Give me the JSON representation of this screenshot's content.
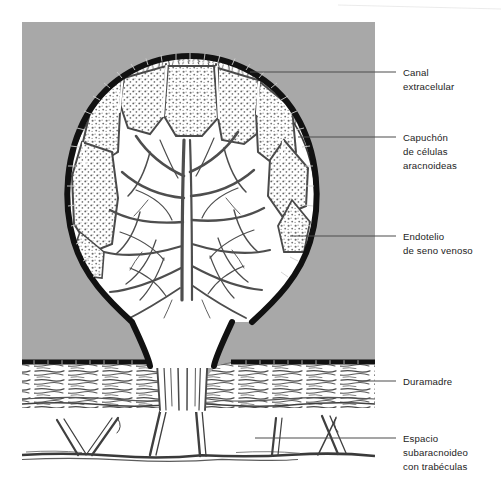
{
  "figure": {
    "background_color": "#ffffff",
    "panel": {
      "name": "illustration-panel",
      "fill_color": "#a8a8a8",
      "x": 22,
      "y": 22,
      "width": 353,
      "height": 448
    },
    "ink_color": "#333333",
    "dark_rim_color": "#111111",
    "tissue_fill": "#ffffff"
  },
  "labels": [
    {
      "id": "canal-extracelular",
      "lines": [
        "Canal",
        "extracelular"
      ],
      "text_x": 403,
      "text_y": 76,
      "line_height": 14,
      "leader": {
        "x1": 250,
        "y1": 72,
        "x2": 396,
        "y2": 72
      }
    },
    {
      "id": "capuchon-celulas-aracnoideas",
      "lines": [
        "Capuchón",
        "de células",
        "aracnoideas"
      ],
      "text_x": 403,
      "text_y": 141,
      "line_height": 14,
      "leader": {
        "x1": 298,
        "y1": 137,
        "x2": 396,
        "y2": 137
      }
    },
    {
      "id": "endotelio-seno-venoso",
      "lines": [
        "Endotelio",
        "de seno venoso"
      ],
      "text_x": 403,
      "text_y": 240,
      "line_height": 14,
      "leader": {
        "x1": 290,
        "y1": 236,
        "x2": 396,
        "y2": 236
      }
    },
    {
      "id": "duramadre",
      "lines": [
        "Duramadre"
      ],
      "text_x": 403,
      "text_y": 385,
      "line_height": 14,
      "leader": {
        "x1": 358,
        "y1": 381,
        "x2": 396,
        "y2": 381
      }
    },
    {
      "id": "espacio-subaracnoideo",
      "lines": [
        "Espacio",
        "subaracnoideo",
        "con trabéculas"
      ],
      "text_x": 403,
      "text_y": 442,
      "line_height": 14,
      "leader": {
        "x1": 255,
        "y1": 438,
        "x2": 396,
        "y2": 438
      }
    }
  ],
  "structures": [
    {
      "id": "arachnoid-villus-body",
      "name": "arachnoid-villus-body"
    },
    {
      "id": "venous-sinus-endothelium-rim",
      "name": "venous-sinus-endothelium-rim"
    },
    {
      "id": "arachnoid-cap-cells",
      "name": "arachnoid-cap-cells"
    },
    {
      "id": "extracellular-channels",
      "name": "extracellular-channels"
    },
    {
      "id": "villus-stalk-neck",
      "name": "villus-stalk-neck"
    },
    {
      "id": "dura-mater-band",
      "name": "dura-mater-band"
    },
    {
      "id": "subarachnoid-space",
      "name": "subarachnoid-space"
    },
    {
      "id": "subarachnoid-trabeculae",
      "name": "subarachnoid-trabeculae"
    },
    {
      "id": "pia-arachnoid-floor",
      "name": "pia-arachnoid-floor"
    }
  ],
  "artifacts": {
    "scan_edge_top": {
      "x1": 338,
      "y1": 5,
      "x2": 501,
      "y2": 9
    }
  }
}
